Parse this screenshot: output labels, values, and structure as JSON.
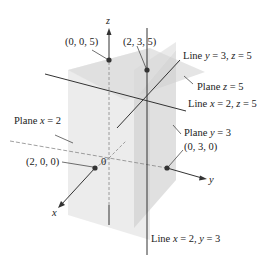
{
  "figure": {
    "type": "3d-coordinate-diagram",
    "axes": {
      "x_label": "x",
      "y_label": "y",
      "z_label": "z",
      "origin_label": "0"
    },
    "points": [
      {
        "id": "p005",
        "label": "(0, 0, 5)"
      },
      {
        "id": "p235",
        "label": "(2, 3, 5)"
      },
      {
        "id": "p200",
        "label": "(2, 0, 0)"
      },
      {
        "id": "p030",
        "label": "(0, 3, 0)"
      }
    ],
    "annotations": {
      "line_y3_z5": {
        "prefix": "Line ",
        "v1": "y",
        "eq1": " = 3, ",
        "v2": "z",
        "eq2": " = 5"
      },
      "plane_z5": {
        "prefix": "Plane ",
        "v1": "z",
        "eq1": " = 5"
      },
      "line_x2_z5": {
        "prefix": "Line ",
        "v1": "x",
        "eq1": " = 2, ",
        "v2": "z",
        "eq2": " = 5"
      },
      "plane_x2": {
        "prefix": "Plane ",
        "v1": "x",
        "eq1": " = 2"
      },
      "plane_y3": {
        "prefix": "Plane ",
        "v1": "y",
        "eq1": " = 3"
      },
      "line_x2_y3": {
        "prefix": "Line ",
        "v1": "x",
        "eq1": " = 2, ",
        "v2": "y",
        "eq2": " = 3"
      }
    },
    "colors": {
      "plane_fill": "#d9d9d9",
      "plane_fill_dark": "#c8c8c8",
      "line": "#333333",
      "point": "#333333",
      "dashed": "#999999"
    }
  }
}
